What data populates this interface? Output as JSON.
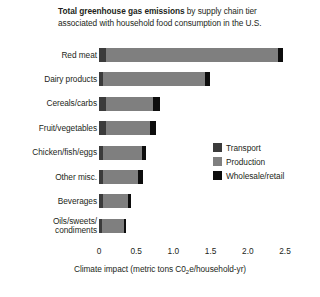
{
  "title": {
    "line1_bold": "Total greenhouse gas emissions",
    "line1_rest": " by supply chain tier",
    "line2": "associated with household food consumption in the U.S."
  },
  "axis": {
    "xlabel_pre": "Climate impact (metric tons C0",
    "xlabel_sub": "2",
    "xlabel_post": "e/household-yr)",
    "ticks": [
      "0",
      "0.5",
      "1.0",
      "1.5",
      "2.0",
      "2.5"
    ]
  },
  "legend": {
    "items": [
      {
        "label": "Transport",
        "color": "#3b3b3b"
      },
      {
        "label": "Production",
        "color": "#7f7f7f"
      },
      {
        "label": "Wholesale/retail",
        "color": "#0d0d0d"
      }
    ]
  },
  "chart_data": {
    "type": "bar",
    "orientation": "horizontal",
    "stacked": true,
    "title": "Total greenhouse gas emissions by supply chain tier associated with household food consumption in the U.S.",
    "xlabel": "Climate impact (metric tons C02e/household-yr)",
    "ylabel": "",
    "xlim": [
      0,
      2.5
    ],
    "xticks": [
      0,
      0.5,
      1.0,
      1.5,
      2.0,
      2.5
    ],
    "grid": false,
    "legend_position": "right-middle",
    "categories": [
      "Red meat",
      "Dairy products",
      "Cereals/carbs",
      "Fruit/vegetables",
      "Chicken/fish/eggs",
      "Other misc.",
      "Beverages",
      "Oils/sweets/\ncondiments"
    ],
    "series": [
      {
        "name": "Transport",
        "color": "#3b3b3b",
        "values": [
          0.09,
          0.05,
          0.1,
          0.1,
          0.05,
          0.05,
          0.05,
          0.04
        ]
      },
      {
        "name": "Production",
        "color": "#7f7f7f",
        "values": [
          2.32,
          1.38,
          0.63,
          0.58,
          0.53,
          0.48,
          0.34,
          0.29
        ]
      },
      {
        "name": "Wholesale/retail",
        "color": "#0d0d0d",
        "values": [
          0.06,
          0.06,
          0.09,
          0.08,
          0.05,
          0.06,
          0.04,
          0.03
        ]
      }
    ],
    "totals": [
      2.47,
      1.49,
      0.82,
      0.76,
      0.63,
      0.59,
      0.43,
      0.36
    ]
  }
}
